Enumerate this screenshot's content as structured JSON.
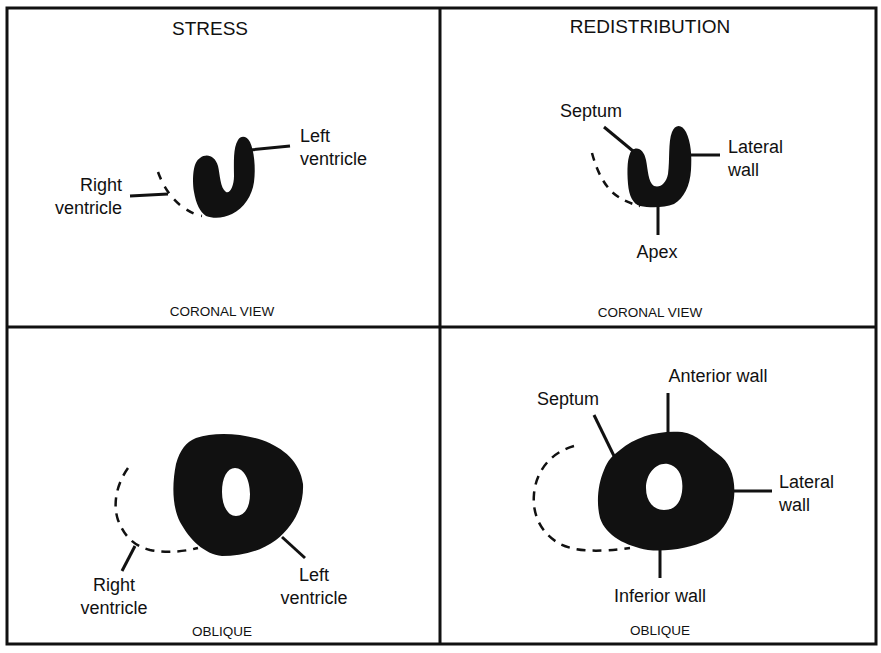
{
  "panels": [
    {
      "id": "stress-coronal",
      "title": "STRESS",
      "view": "CORONAL VIEW",
      "labels": {
        "left_ventricle_1": "Left",
        "left_ventricle_2": "ventricle",
        "right_ventricle_1": "Right",
        "right_ventricle_2": "ventricle"
      }
    },
    {
      "id": "redistribution-coronal",
      "title": "REDISTRIBUTION",
      "view": "CORONAL VIEW",
      "labels": {
        "septum": "Septum",
        "lateral_wall_1": "Lateral",
        "lateral_wall_2": "wall",
        "apex": "Apex"
      }
    },
    {
      "id": "stress-oblique",
      "title": "",
      "view": "OBLIQUE",
      "labels": {
        "right_ventricle_1": "Right",
        "right_ventricle_2": "ventricle",
        "left_ventricle_1": "Left",
        "left_ventricle_2": "ventricle"
      }
    },
    {
      "id": "redistribution-oblique",
      "title": "",
      "view": "OBLIQUE",
      "labels": {
        "septum": "Septum",
        "anterior_wall": "Anterior wall",
        "lateral_wall_1": "Lateral",
        "lateral_wall_2": "wall",
        "inferior_wall": "Inferior wall"
      }
    }
  ],
  "colors": {
    "ink": "#111111",
    "background": "#ffffff"
  }
}
